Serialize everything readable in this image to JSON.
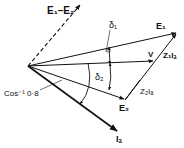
{
  "diagram": {
    "type": "phasor-diagram",
    "origin": [
      28,
      66
    ],
    "phasors": [
      {
        "id": "e1-minus-e2",
        "label": "E₁–E₂",
        "tip": [
          81,
          4
        ],
        "style": "dashed"
      },
      {
        "id": "e1",
        "label": "E₁",
        "tip": [
          177,
          33
        ],
        "style": "solid"
      },
      {
        "id": "v",
        "label": "V",
        "tip": [
          154,
          61
        ],
        "style": "solid"
      },
      {
        "id": "e2",
        "label": "E₂",
        "tip": [
          125,
          100
        ],
        "style": "solid"
      },
      {
        "id": "ia",
        "label": "Iₐ",
        "tip": [
          118,
          132
        ],
        "style": "solid-bold"
      }
    ],
    "drop_vectors": [
      {
        "id": "z1ia",
        "label": "Z₁Iₐ",
        "from": [
          125,
          100
        ],
        "to": [
          177,
          33
        ]
      },
      {
        "id": "z2ia",
        "label": "Z₂Iₐ",
        "from": [
          125,
          100
        ],
        "to": [
          154,
          61
        ]
      }
    ],
    "angles": [
      {
        "id": "delta1",
        "label": "δ₁"
      },
      {
        "id": "delta2",
        "label": "δ₂"
      },
      {
        "id": "pf-angle",
        "label": "Cos⁻¹ 0·8"
      }
    ]
  },
  "labels": {
    "e1_minus_e2": "E₁–E₂",
    "e1": "E₁",
    "v": "V",
    "e2": "E₂",
    "ia": "Iₐ",
    "z1ia": "Z₁Iₐ",
    "z2ia": "Z₂Iₐ",
    "delta1": "δ₁",
    "delta2": "δ₂",
    "pf_angle": "Cos⁻¹ 0·8"
  }
}
